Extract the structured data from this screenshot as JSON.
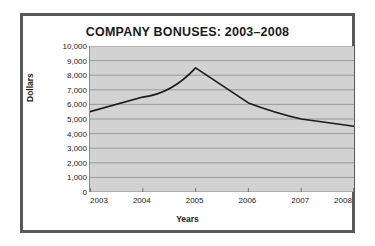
{
  "chart_data": {
    "type": "line",
    "title": "COMPANY BONUSES: 2003–2008",
    "xlabel": "Years",
    "ylabel": "Dollars",
    "categories": [
      "2003",
      "2004",
      "2005",
      "2006",
      "2007",
      "2008"
    ],
    "x": [
      2003,
      2004,
      2005,
      2006,
      2007,
      2008
    ],
    "values": [
      5500,
      6500,
      8500,
      6100,
      5000,
      4500
    ],
    "series": [
      {
        "name": "Bonuses",
        "values": [
          5500,
          6500,
          8500,
          6100,
          5000,
          4500
        ],
        "color": "#1a1a1a"
      }
    ],
    "ylim": [
      0,
      10000
    ],
    "ytick_step": 1000,
    "ytick_labels": [
      "10,000",
      "9,000",
      "8,000",
      "7,000",
      "6,000",
      "5,000",
      "4,000",
      "3,000",
      "2,000",
      "1,000",
      "0"
    ],
    "ytick_values": [
      10000,
      9000,
      8000,
      7000,
      6000,
      5000,
      4000,
      3000,
      2000,
      1000,
      0
    ],
    "xtick_labels": [
      "2003",
      "2004",
      "2005",
      "2006",
      "2007",
      "2008"
    ],
    "grid": "horizontal",
    "legend": "none",
    "plot_background": "#d2d2d2",
    "gridline_color": "#8a8a8a",
    "frame_color": "#595959",
    "page_background": "#ffffff",
    "annotations": []
  }
}
